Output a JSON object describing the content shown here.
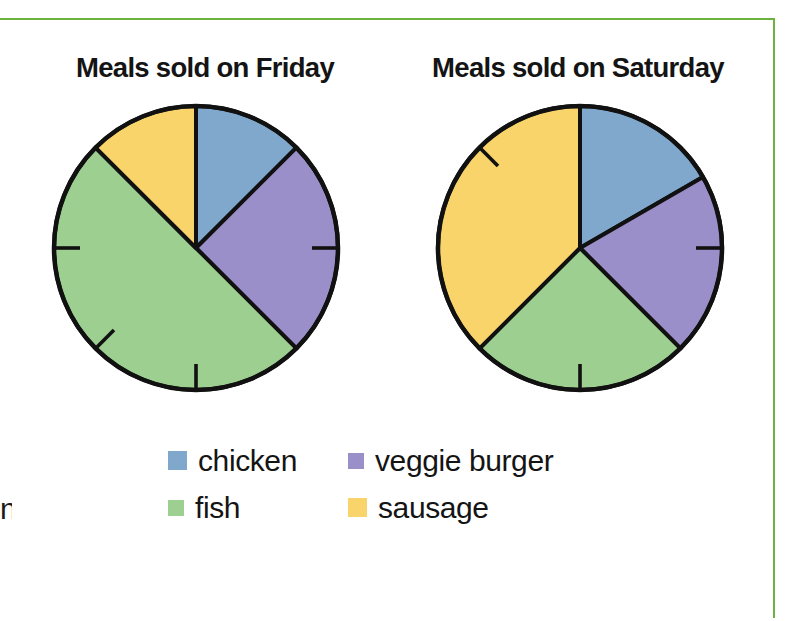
{
  "page": {
    "border_color": "#6cb23f",
    "background": "#ffffff",
    "edge_remnant_text": "n"
  },
  "charts": [
    {
      "id": "friday",
      "title": "Meals sold on Friday"
    },
    {
      "id": "saturday",
      "title": "Meals sold on Saturday"
    }
  ],
  "legend": {
    "rows": [
      [
        {
          "label": "chicken",
          "color": "#7FA8CC",
          "key": "chicken"
        },
        {
          "label": "veggie burger",
          "color": "#9B8FC9",
          "key": "veggie-burger"
        }
      ],
      [
        {
          "label": "fish",
          "color": "#9CCF90",
          "key": "fish"
        },
        {
          "label": "sausage",
          "color": "#F8D46B",
          "key": "sausage"
        }
      ]
    ]
  },
  "chart_data": [
    {
      "type": "pie",
      "title": "Meals sold on Friday",
      "labels": [
        "chicken",
        "veggie burger",
        "fish",
        "sausage"
      ],
      "colors": [
        "#7FA8CC",
        "#9B8FC9",
        "#9CCF90",
        "#F8D46B"
      ],
      "values": [
        0.125,
        0.25,
        0.5,
        0.125
      ],
      "fractions": [
        "1/8",
        "1/4",
        "1/2",
        "1/8"
      ],
      "percentages": [
        12.5,
        25,
        50,
        12.5
      ],
      "start_angle_deg": 0,
      "direction": "clockwise",
      "slice_boundaries_deg": [
        0,
        45,
        135,
        315,
        360
      ],
      "tick_marks_deg": [
        90,
        180,
        225,
        270
      ],
      "legend": "below",
      "grid": false
    },
    {
      "type": "pie",
      "title": "Meals sold on Saturday",
      "labels": [
        "chicken",
        "veggie burger",
        "fish",
        "sausage"
      ],
      "colors": [
        "#7FA8CC",
        "#9B8FC9",
        "#9CCF90",
        "#F8D46B"
      ],
      "values": [
        0.1667,
        0.2083,
        0.25,
        0.375
      ],
      "fractions": [
        "1/6",
        "5/24",
        "1/4",
        "3/8"
      ],
      "percentages": [
        16.7,
        20.8,
        25,
        37.5
      ],
      "start_angle_deg": 0,
      "direction": "clockwise",
      "slice_boundaries_deg": [
        0,
        60,
        135,
        225,
        360
      ],
      "tick_marks_deg": [
        90,
        180,
        315
      ],
      "legend": "below",
      "grid": false
    }
  ]
}
